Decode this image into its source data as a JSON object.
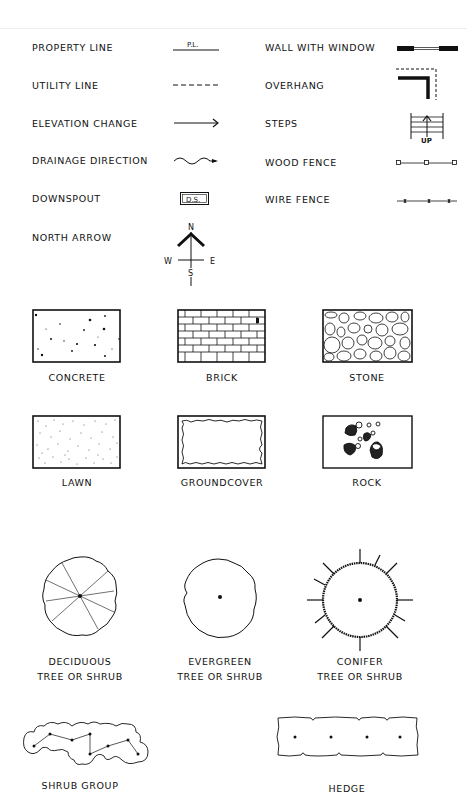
{
  "line_symbols": {
    "left": [
      {
        "label": "PROPERTY LINE",
        "symbol": "property-line",
        "symbol_text": "P.L."
      },
      {
        "label": "UTILITY LINE",
        "symbol": "utility-line"
      },
      {
        "label": "ELEVATION CHANGE",
        "symbol": "elevation-arrow"
      },
      {
        "label": "DRAINAGE DIRECTION",
        "symbol": "wavy-arrow"
      },
      {
        "label": "DOWNSPOUT",
        "symbol": "downspout-box",
        "symbol_text": "D.S."
      },
      {
        "label": "NORTH ARROW",
        "symbol": "north-arrow"
      }
    ],
    "right": [
      {
        "label": "WALL WITH WINDOW",
        "symbol": "wall-window"
      },
      {
        "label": "OVERHANG",
        "symbol": "overhang"
      },
      {
        "label": "STEPS",
        "symbol": "steps",
        "symbol_text": "UP"
      },
      {
        "label": "WOOD FENCE",
        "symbol": "wood-fence"
      },
      {
        "label": "WIRE FENCE",
        "symbol": "wire-fence"
      }
    ]
  },
  "north_arrow": {
    "n": "N",
    "s": "S",
    "e": "E",
    "w": "W"
  },
  "materials": [
    {
      "label": "CONCRETE"
    },
    {
      "label": "BRICK"
    },
    {
      "label": "STONE"
    },
    {
      "label": "LAWN"
    },
    {
      "label": "GROUNDCOVER"
    },
    {
      "label": "ROCK"
    }
  ],
  "plants": [
    {
      "line1": "DECIDUOUS",
      "line2": "TREE OR SHRUB"
    },
    {
      "line1": "EVERGREEN",
      "line2": "TREE OR SHRUB"
    },
    {
      "line1": "CONIFER",
      "line2": "TREE OR SHRUB"
    }
  ],
  "groups": [
    {
      "label": "SHRUB GROUP"
    },
    {
      "label": "HEDGE"
    }
  ],
  "colors": {
    "ink": "#111111",
    "paper": "#ffffff"
  }
}
